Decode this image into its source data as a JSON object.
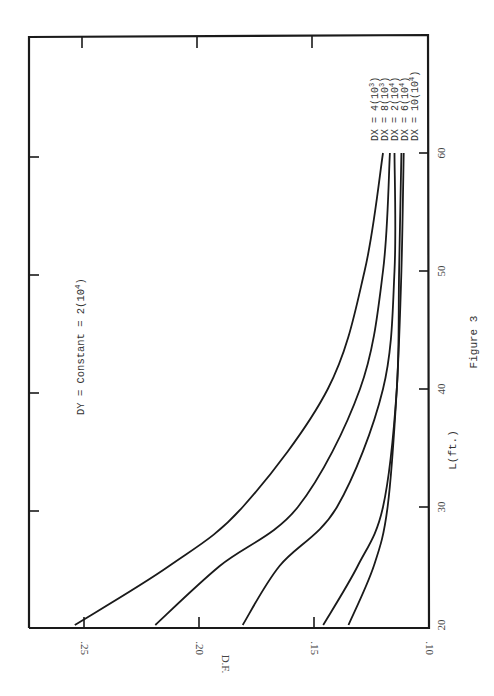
{
  "chart_data": {
    "type": "line",
    "title": "",
    "caption": "Figure 3",
    "xlabel": "L(ft.)",
    "ylabel": "D.F.",
    "xlim": [
      20,
      69
    ],
    "ylim": [
      0.1,
      0.2715
    ],
    "x_ticks": [
      20,
      30,
      40,
      50,
      60
    ],
    "x_tick_labels": [
      "20",
      "30",
      "40",
      "50",
      "60"
    ],
    "y_ticks": [
      0.1,
      0.15,
      0.2,
      0.25
    ],
    "y_tick_labels": [
      ".10",
      ".15",
      ".20",
      ".25"
    ],
    "grid": false,
    "orientation": "rotated 90 degrees counterclockwise (page landscape)",
    "annotation": "DY = Constant = 2(10^4)",
    "annotation_parts": {
      "base": "DY = Constant = 2(10",
      "exp": "4",
      "close": ")"
    },
    "x": [
      20,
      25,
      30,
      40,
      50,
      60
    ],
    "series": [
      {
        "name": "DX = 4(10^3)",
        "label_base": "DX = 4(10",
        "label_exp": "3",
        "values": [
          0.254,
          0.213,
          0.181,
          0.144,
          0.128,
          0.12
        ]
      },
      {
        "name": "DX = 8(10^3)",
        "label_base": "DX = 8(10",
        "label_exp": "3",
        "values": [
          0.219,
          0.191,
          0.157,
          0.13,
          0.12,
          0.117
        ]
      },
      {
        "name": "DX = 2(10^4)",
        "label_base": "DX = 2(10",
        "label_exp": "4",
        "values": [
          0.181,
          0.165,
          0.14,
          0.12,
          0.115,
          0.115
        ]
      },
      {
        "name": "DX = 6(10^4)",
        "label_base": "DX = 6(10",
        "label_exp": "4",
        "values": [
          0.146,
          0.131,
          0.12,
          0.114,
          0.113,
          0.112
        ]
      },
      {
        "name": "DX = 10(10^4)",
        "label_base": "DX = 10(10",
        "label_exp": "4",
        "values": [
          0.135,
          0.124,
          0.118,
          0.114,
          0.112,
          0.111
        ]
      }
    ],
    "legend_position": "right end of curves (upper right, rotated)"
  },
  "colors": {
    "ink": "#1a1a1a",
    "paper": "#ffffff",
    "label": "#444444"
  }
}
